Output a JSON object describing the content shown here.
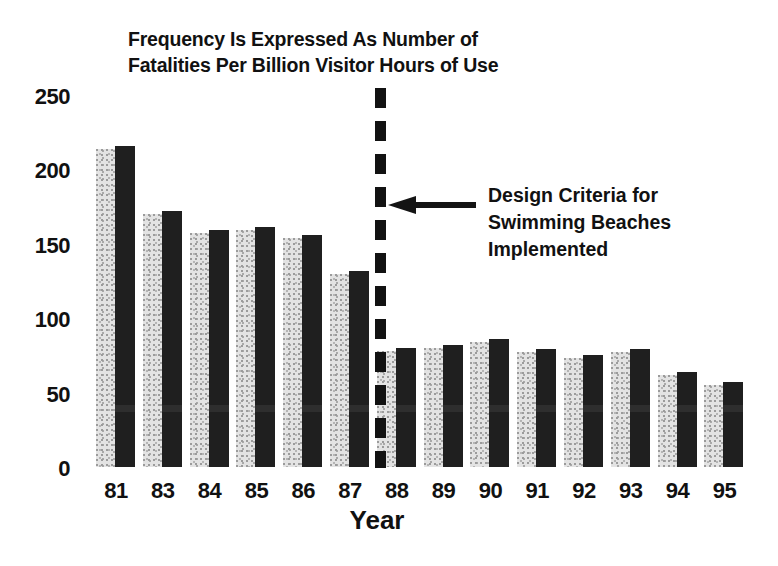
{
  "chart_data": {
    "type": "bar",
    "title": "Frequency Is Expressed As Number of Fatalities Per Billion Visitor Hours of Use",
    "title_lines": [
      "Frequency Is Expressed As Number of",
      "Fatalities Per Billion Visitor Hours of Use"
    ],
    "xlabel": "Year",
    "ylabel": "",
    "ylim": [
      0,
      250
    ],
    "yticks": [
      250,
      200,
      150,
      100,
      50,
      0
    ],
    "grid": false,
    "legend": false,
    "categories": [
      "81",
      "83",
      "84",
      "85",
      "86",
      "87",
      "88",
      "89",
      "90",
      "91",
      "92",
      "93",
      "94",
      "95"
    ],
    "values": [
      216,
      172,
      159,
      161,
      156,
      132,
      80,
      82,
      86,
      79,
      75,
      79,
      64,
      57
    ],
    "series": [
      {
        "name": "Fatalities per billion visitor hours",
        "values": [
          216,
          172,
          159,
          161,
          156,
          132,
          80,
          82,
          86,
          79,
          75,
          79,
          64,
          57
        ]
      }
    ],
    "annotations": [
      {
        "name": "design-criteria-marker",
        "text": "Design Criteria for Swimming Beaches Implemented",
        "text_lines": [
          "Design Criteria for",
          "Swimming Beaches",
          "Implemented"
        ],
        "marker_style": "vertical-dashed-line",
        "marker_between_categories": [
          "87",
          "88"
        ]
      }
    ],
    "colors": {
      "bar_dark": "#1f1f1f",
      "bar_light": "#e3e3e3",
      "text": "#111111",
      "background": "#ffffff"
    }
  },
  "axes": {
    "y_ticks": [
      "250",
      "200",
      "150",
      "100",
      "50",
      "0"
    ],
    "x_ticks": [
      "81",
      "83",
      "84",
      "85",
      "86",
      "87",
      "88",
      "89",
      "90",
      "91",
      "92",
      "93",
      "94",
      "95"
    ],
    "x_title": "Year"
  },
  "title": {
    "line1": "Frequency Is Expressed As Number of",
    "line2": "Fatalities Per Billion Visitor Hours of Use"
  },
  "annotation": {
    "line1": "Design Criteria for",
    "line2": "Swimming Beaches",
    "line3": "Implemented"
  }
}
